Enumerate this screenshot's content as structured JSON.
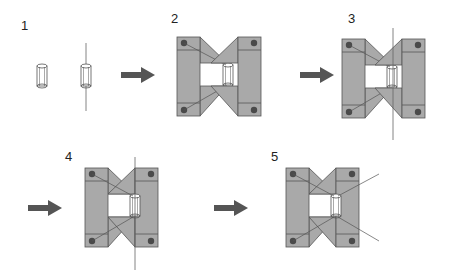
{
  "figure": {
    "steps": [
      {
        "label": "1",
        "content": "two-cylinders"
      },
      {
        "label": "2",
        "content": "open-brackets-cylinder-left"
      },
      {
        "label": "3",
        "content": "open-brackets-with-axis-line"
      },
      {
        "label": "4",
        "content": "closed-brackets-with-axis-line"
      },
      {
        "label": "5",
        "content": "closed-brackets-final"
      }
    ],
    "colors": {
      "fill": "#a9a9a9",
      "stroke": "#555555",
      "bolt": "#4a4a4a",
      "arrow": "#555555",
      "line": "#666666"
    }
  }
}
